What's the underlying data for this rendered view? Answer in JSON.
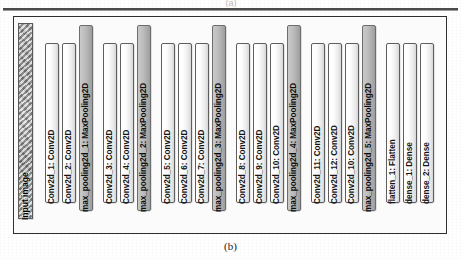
{
  "figure": {
    "caption": "(b)",
    "top_panel_marker": "(a)"
  },
  "network": {
    "title": "CNN architecture layer stack",
    "blocks": [
      {
        "label": "Input image",
        "type": "input"
      },
      {
        "label": "Conv2d_1: Conv2D",
        "type": "conv"
      },
      {
        "label": "Conv2d_2: Conv2D",
        "type": "conv"
      },
      {
        "label": "max_pooling2d_1: MaxPooling2D",
        "type": "pool"
      },
      {
        "label": "Conv2d_3: Conv2D",
        "type": "conv"
      },
      {
        "label": "Conv2d_4: Conv2D",
        "type": "conv"
      },
      {
        "label": "max_pooling2d_2: MaxPooling2D",
        "type": "pool"
      },
      {
        "label": "Conv2d_5: Conv2D",
        "type": "conv"
      },
      {
        "label": "Conv2d_6: Conv2D",
        "type": "conv"
      },
      {
        "label": "Conv2d_7: Conv2D",
        "type": "conv"
      },
      {
        "label": "max_pooling2d_3: MaxPooling2D",
        "type": "pool"
      },
      {
        "label": "Conv2d_8: Conv2D",
        "type": "conv"
      },
      {
        "label": "Conv2d_9: Conv2D",
        "type": "conv"
      },
      {
        "label": "Conv2d_10: Conv2D",
        "type": "conv"
      },
      {
        "label": "max_pooling2d_4: MaxPooling2D",
        "type": "pool"
      },
      {
        "label": "Conv2d_11: Conv2D",
        "type": "conv"
      },
      {
        "label": "Conv2d_12: Conv2D",
        "type": "conv"
      },
      {
        "label": "Conv2d_10: Conv2D",
        "type": "conv"
      },
      {
        "label": "max_pooling2d_5: MaxPooling2D",
        "type": "pool"
      },
      {
        "label": "flatten_1: Flatten",
        "type": "conv"
      },
      {
        "label": "dense_1: Dense",
        "type": "conv"
      },
      {
        "label": "dense_2: Dense",
        "type": "conv"
      }
    ]
  },
  "colors": {
    "pool_fill": "#b5b5b5",
    "conv_fill": "#ffffff",
    "frame_border": "#2f2f2f",
    "text": "#141414"
  }
}
